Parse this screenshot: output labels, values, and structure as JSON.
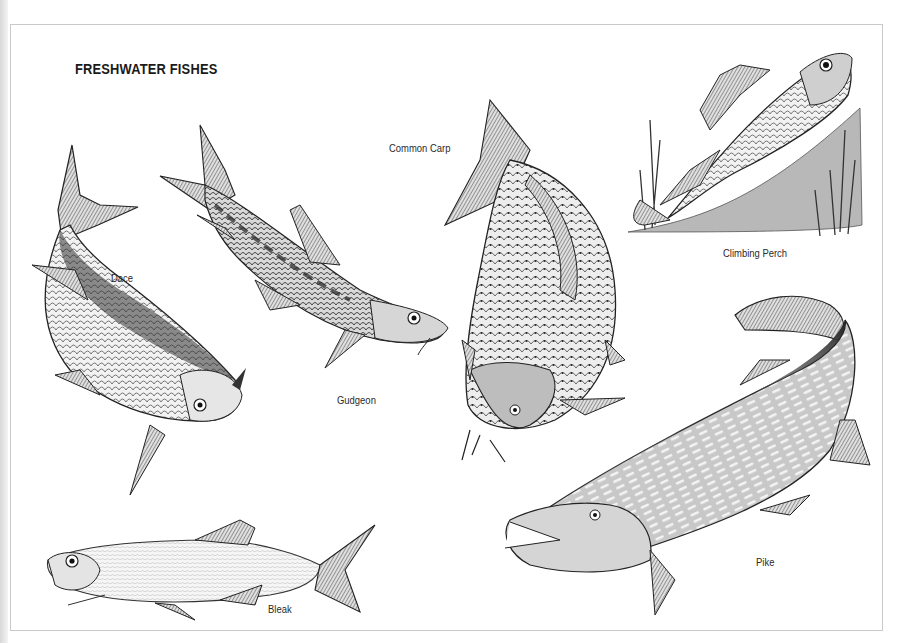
{
  "plate": {
    "title": "FRESHWATER FISHES",
    "colors": {
      "ink": "#1a1a1a",
      "border": "#c9c9c9",
      "paper": "#ffffff"
    }
  },
  "fishes": [
    {
      "id": "dace",
      "label": "Dace"
    },
    {
      "id": "gudgeon",
      "label": "Gudgeon"
    },
    {
      "id": "common-carp",
      "label": "Common Carp"
    },
    {
      "id": "climbing-perch",
      "label": "Climbing Perch"
    },
    {
      "id": "pike",
      "label": "Pike"
    },
    {
      "id": "bleak",
      "label": "Bleak"
    }
  ]
}
